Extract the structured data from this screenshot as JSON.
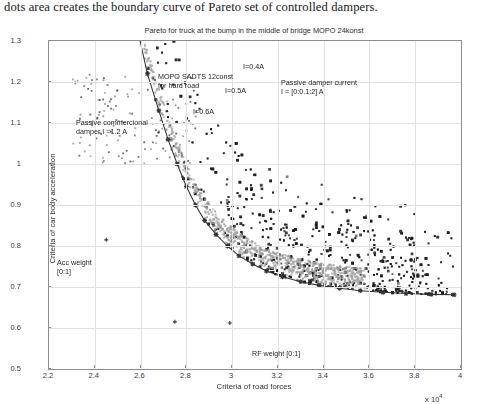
{
  "caption": "dots area creates the boundary curve of Pareto set of controlled dampers.",
  "chart_data": {
    "type": "scatter",
    "title": "Pareto  for truck at the bump in the middle of bridge  MOPO 24konst",
    "xlabel": "Criteria of road forces",
    "ylabel": "Criteria of car body acceleration",
    "x_multiplier": "x 10",
    "x_multiplier_exp": "4",
    "xlim": [
      2.2,
      4.0
    ],
    "ylim": [
      0.5,
      1.3
    ],
    "xticks": [
      "2.2",
      "2.4",
      "2.6",
      "2.8",
      "3",
      "3.2",
      "3.4",
      "3.6",
      "3.8",
      "4"
    ],
    "xtick_values": [
      2.2,
      2.4,
      2.6,
      2.8,
      3.0,
      3.2,
      3.4,
      3.6,
      3.8,
      4.0
    ],
    "yticks": [
      "0.5",
      "0.6",
      "0.7",
      "0.8",
      "0.9",
      "1",
      "1.1",
      "1.2",
      "1.3"
    ],
    "ytick_values": [
      0.5,
      0.6,
      0.7,
      0.8,
      0.9,
      1.0,
      1.1,
      1.2,
      1.3
    ],
    "grid": true,
    "legend_position": "none",
    "colors": {
      "dark_dots": "#1c1c1c",
      "gray_dots": "#9a9a9a",
      "curve": "#333333",
      "grid": "#e2e2e2",
      "axis": "#8d8d8d"
    },
    "series": [
      {
        "name": "MOPO SADTS 12const for hard road",
        "style": "dark-scatter",
        "note": "dense dark cloud, core cluster near (2.38, 0.92)",
        "cluster_core": [
          2.38,
          0.92
        ],
        "n_points": 2600
      },
      {
        "name": "Pareto boundary gray band",
        "style": "gray-scatter",
        "note": "light gray dots forming the lower boundary band of the cloud",
        "n_points": 900
      },
      {
        "name": "Passive damper current I = [0:0.1:2] A",
        "style": "line-with-markers",
        "note": "curve rising steeply from lower-right plateau up to top-left-of-center",
        "points": [
          [
            2.59,
            1.32
          ],
          [
            2.63,
            1.22
          ],
          [
            2.68,
            1.13
          ],
          [
            2.72,
            1.06
          ],
          [
            2.76,
            1.0
          ],
          [
            2.8,
            0.945
          ],
          [
            2.84,
            0.9
          ],
          [
            2.88,
            0.862
          ],
          [
            2.93,
            0.828
          ],
          [
            2.98,
            0.8
          ],
          [
            3.03,
            0.776
          ],
          [
            3.09,
            0.756
          ],
          [
            3.15,
            0.739
          ],
          [
            3.22,
            0.725
          ],
          [
            3.3,
            0.713
          ],
          [
            3.38,
            0.704
          ],
          [
            3.47,
            0.697
          ],
          [
            3.56,
            0.691
          ],
          [
            3.66,
            0.687
          ],
          [
            3.76,
            0.684
          ],
          [
            3.87,
            0.682
          ],
          [
            3.97,
            0.681
          ]
        ],
        "marker_labels": [
          {
            "label": "I=0.4A",
            "x": 2.645,
            "y": 1.205
          },
          {
            "label": "I=0.5A",
            "x": 2.735,
            "y": 1.048
          },
          {
            "label": "I=0.6A",
            "x": 2.815,
            "y": 0.932
          }
        ]
      }
    ],
    "annotations": [
      {
        "name": "i-04a-label",
        "text": "I=0.4A",
        "x_px": 243,
        "y_px": 44
      },
      {
        "name": "i-05a-label",
        "text": "I=0.5A",
        "x_px": 225,
        "y_px": 68
      },
      {
        "name": "i-06a-label",
        "text": "I=0.6A",
        "x_px": 193,
        "y_px": 89
      },
      {
        "name": "mopo-sadts-label",
        "text": "MOPO SADTS 12const\nfor hard road",
        "x_px": 158,
        "y_px": 54
      },
      {
        "name": "passive-damper-current-label",
        "text": "Passive damper current\nI = [0:0.1:2] A",
        "x_px": 281,
        "y_px": 60
      },
      {
        "name": "passive-commercional-label",
        "text": "Passive commercional\ndamper I =1.2 A",
        "x_px": 76,
        "y_px": 100
      },
      {
        "name": "acc-weight-label",
        "text": "Acc weight\n[0:1]",
        "x_px": 57,
        "y_px": 240
      },
      {
        "name": "rf-weight-label",
        "text": "RF weight [0:1]",
        "x_px": 252,
        "y_px": 331
      }
    ]
  }
}
